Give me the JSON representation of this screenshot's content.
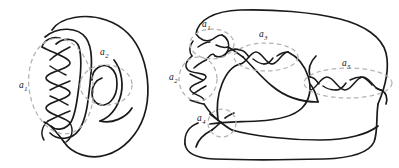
{
  "figure": {
    "name": "knot-link-diagram-figure",
    "background_color": "#ffffff",
    "stroke_color": "#1a1a1a",
    "annotation_color": "#b0b0b0",
    "label_color": "#111111"
  },
  "diagrams": [
    {
      "name": "left-link-diagram",
      "description": "Closed link diagram with a vertical twist braid region and a small clasp region",
      "annotations": [
        {
          "id": "a1",
          "label": "a",
          "subscript": "1",
          "shape": "dashed-ellipse",
          "cx": 61,
          "cy": 86,
          "rx": 32,
          "ry": 48,
          "rotation": -8,
          "label_x": 19,
          "label_y": 88,
          "crossings": 5,
          "region": "vertical-twist-band"
        },
        {
          "id": "a2",
          "label": "a",
          "subscript": "2",
          "shape": "dashed-ellipse",
          "cx": 106,
          "cy": 85,
          "rx": 26,
          "ry": 20,
          "rotation": 0,
          "label_x": 100,
          "label_y": 55,
          "crossings": 2,
          "region": "clasp"
        }
      ]
    },
    {
      "name": "right-link-diagram",
      "description": "Larger closed link diagram with five marked tangle regions",
      "annotations": [
        {
          "id": "a1",
          "label": "a",
          "subscript": "1",
          "shape": "dashed-ellipse",
          "cx": 212,
          "cy": 44,
          "rx": 22,
          "ry": 15,
          "rotation": 0,
          "label_x": 202,
          "label_y": 27,
          "crossings": 2,
          "region": "upper-left-tangle"
        },
        {
          "id": "a2",
          "label": "a",
          "subscript": "2",
          "shape": "dashed-ellipse",
          "cx": 198,
          "cy": 79,
          "rx": 19,
          "ry": 22,
          "rotation": 0,
          "label_x": 169,
          "label_y": 80,
          "crossings": 3,
          "region": "left-vertical-twist"
        },
        {
          "id": "a3",
          "label": "a",
          "subscript": "3",
          "shape": "dashed-ellipse",
          "cx": 266,
          "cy": 57,
          "rx": 32,
          "ry": 14,
          "rotation": 0,
          "label_x": 259,
          "label_y": 37,
          "crossings": 3,
          "region": "middle-horizontal-twist"
        },
        {
          "id": "a4",
          "label": "a",
          "subscript": "4",
          "shape": "dashed-ellipse",
          "cx": 222,
          "cy": 123,
          "rx": 14,
          "ry": 14,
          "rotation": 0,
          "label_x": 197,
          "label_y": 121,
          "crossings": 1,
          "region": "lower-crossing"
        },
        {
          "id": "a5",
          "label": "a",
          "subscript": "5",
          "shape": "dashed-ellipse",
          "cx": 348,
          "cy": 83,
          "rx": 44,
          "ry": 15,
          "rotation": 0,
          "label_x": 342,
          "label_y": 66,
          "crossings": 3,
          "region": "right-horizontal-twist"
        }
      ]
    }
  ]
}
